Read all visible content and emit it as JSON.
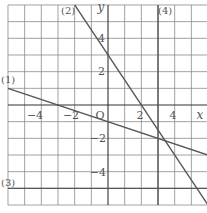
{
  "chart_data": {
    "type": "line",
    "title": "",
    "xlabel": "x",
    "ylabel": "y",
    "origin_label": "O",
    "xlim": [
      -6,
      6
    ],
    "ylim": [
      -6,
      6
    ],
    "grid": true,
    "grid_step": 1,
    "x_ticks": [
      -4,
      -2,
      2,
      4
    ],
    "y_ticks": [
      4,
      2,
      -2,
      -4
    ],
    "x_tick_labels": [
      "−4",
      "−2",
      "2",
      "4"
    ],
    "y_tick_labels": [
      "4",
      "2",
      "−2",
      "−4"
    ],
    "series": [
      {
        "name": "(1)",
        "equation": "y = -x/3 - 1",
        "slope": -0.3333,
        "intercept": -1,
        "points": [
          [
            -6,
            1
          ],
          [
            0,
            -1
          ],
          [
            3,
            -2
          ],
          [
            6,
            -3
          ]
        ]
      },
      {
        "name": "(2)",
        "equation": "y = -3x/2 + 3",
        "slope": -1.5,
        "intercept": 3,
        "points": [
          [
            -2,
            6
          ],
          [
            0,
            3
          ],
          [
            2,
            0
          ],
          [
            6,
            -6
          ]
        ]
      },
      {
        "name": "(3)",
        "equation": "y = -5",
        "points": [
          [
            -6,
            -5
          ],
          [
            6,
            -5
          ]
        ]
      },
      {
        "name": "(4)",
        "equation": "x = 3",
        "points": [
          [
            3,
            6
          ],
          [
            3,
            -6
          ]
        ]
      }
    ],
    "labels": {
      "l1": "(1)",
      "l2": "(2)",
      "l3": "(3)",
      "l4": "(4)"
    },
    "colors": {
      "grid": "#8a8a8a",
      "axis": "#333333",
      "line": "#555555"
    }
  }
}
